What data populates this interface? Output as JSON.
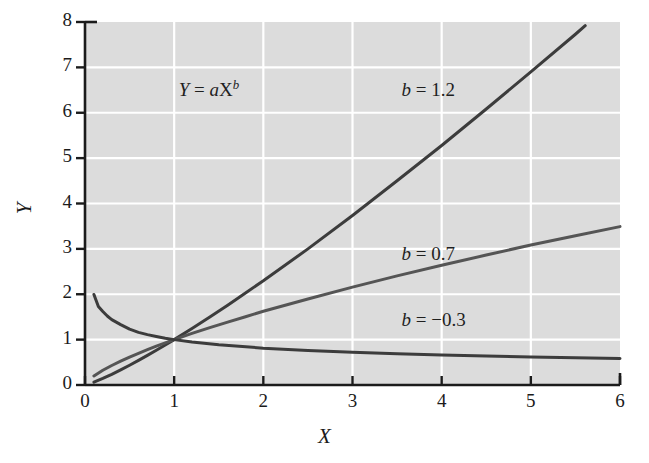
{
  "chart_data": {
    "type": "line",
    "title": "",
    "subtitle": "",
    "xlabel": "X",
    "ylabel": "Y",
    "xlim": [
      0,
      6
    ],
    "ylim": [
      0,
      8
    ],
    "xticks": [
      "0",
      "1",
      "2",
      "3",
      "4",
      "5",
      "6"
    ],
    "yticks": [
      "0",
      "1",
      "2",
      "3",
      "4",
      "5",
      "6",
      "7",
      "8"
    ],
    "grid": true,
    "grid_color": "#ffffff",
    "plot_background": "#dcdcdc",
    "page_background": "#ffffff",
    "legend_position": "inline-annotations",
    "equation_annotation": {
      "text": "Y = aX^b",
      "lhs": "Y",
      "equals": " = ",
      "coefficient": "a",
      "variable": "X",
      "exponent": "b",
      "x": 1.05,
      "y": 6.45
    },
    "series": [
      {
        "name": "b = 1.2",
        "label": "b = 1.2",
        "label_x": 3.55,
        "label_y": 6.45,
        "color": "#3c3c3c",
        "linewidth": 3.0,
        "a": 1,
        "b": 1.2,
        "x": [
          0.1,
          0.2,
          0.3,
          0.4,
          0.5,
          0.6,
          0.7,
          0.8,
          0.9,
          1.0,
          1.2,
          1.4,
          1.6,
          1.8,
          2.0,
          2.5,
          3.0,
          3.5,
          4.0,
          4.5,
          5.0,
          5.5,
          5.61
        ],
        "y": [
          0.063,
          0.145,
          0.236,
          0.333,
          0.435,
          0.542,
          0.652,
          0.765,
          0.881,
          1.0,
          1.245,
          1.498,
          1.76,
          2.029,
          2.297,
          3.0,
          3.737,
          4.501,
          5.278,
          6.083,
          6.899,
          7.73,
          7.92
        ]
      },
      {
        "name": "b = 0.7",
        "label": "b = 0.7",
        "label_x": 3.55,
        "label_y": 2.85,
        "color": "#555555",
        "linewidth": 3.0,
        "a": 1,
        "b": 0.7,
        "x": [
          0.1,
          0.2,
          0.3,
          0.4,
          0.5,
          0.6,
          0.7,
          0.8,
          0.9,
          1.0,
          1.2,
          1.4,
          1.6,
          1.8,
          2.0,
          2.5,
          3.0,
          3.5,
          4.0,
          4.5,
          5.0,
          5.5,
          6.0
        ],
        "y": [
          0.2,
          0.324,
          0.43,
          0.525,
          0.616,
          0.699,
          0.779,
          0.857,
          0.929,
          1.0,
          1.136,
          1.265,
          1.387,
          1.504,
          1.625,
          1.894,
          2.157,
          2.404,
          2.639,
          2.864,
          3.085,
          3.29,
          3.49
        ]
      },
      {
        "name": "b = -0.3",
        "label": "b = −0.3",
        "label_x": 3.55,
        "label_y": 1.38,
        "color": "#3c3c3c",
        "linewidth": 3.0,
        "a": 1,
        "b": -0.3,
        "x": [
          0.1,
          0.15,
          0.2,
          0.25,
          0.3,
          0.4,
          0.5,
          0.6,
          0.7,
          0.8,
          0.9,
          1.0,
          1.2,
          1.5,
          2.0,
          2.5,
          3.0,
          3.5,
          4.0,
          4.5,
          5.0,
          5.5,
          6.0
        ],
        "y": [
          1.995,
          1.73,
          1.62,
          1.52,
          1.44,
          1.33,
          1.23,
          1.16,
          1.11,
          1.07,
          1.03,
          1.0,
          0.947,
          0.888,
          0.812,
          0.76,
          0.72,
          0.688,
          0.66,
          0.637,
          0.617,
          0.599,
          0.583
        ]
      }
    ]
  },
  "axes": {
    "tick_color": "#1b1b1b",
    "spine_color": "#1b1b1b"
  }
}
